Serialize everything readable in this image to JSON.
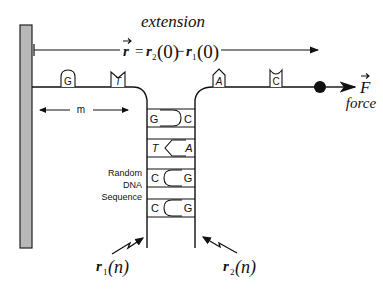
{
  "diagram": {
    "title": "extension",
    "extension_equation": {
      "vector": "r",
      "equals": "=",
      "lhs_r2": "r",
      "sub2": "2",
      "arg0": "(0)",
      "minus": "−",
      "rhs_r1": "r",
      "sub1": "1",
      "arg0b": "(0)"
    },
    "force_label": "force",
    "force_symbol": "F",
    "m_label": "m",
    "sequence_label": [
      "Random",
      "DNA",
      "Sequence"
    ],
    "top_left_bases": [
      "G",
      "T"
    ],
    "top_right_bases": [
      "A",
      "C"
    ],
    "base_pairs": [
      {
        "left": "G",
        "right": "C",
        "left_italic": false,
        "right_italic": false
      },
      {
        "left": "T",
        "right": "A",
        "left_italic": true,
        "right_italic": true
      },
      {
        "left": "C",
        "right": "G",
        "left_italic": false,
        "right_italic": false
      },
      {
        "left": "C",
        "right": "G",
        "left_italic": false,
        "right_italic": false
      }
    ],
    "pointer_labels": [
      {
        "r": "r",
        "sub": "1",
        "arg": "(n)"
      },
      {
        "r": "r",
        "sub": "2",
        "arg": "(n)"
      }
    ],
    "colors": {
      "line": "#111111",
      "wall_fill": "#b8b8b8",
      "background": "#ffffff"
    }
  }
}
